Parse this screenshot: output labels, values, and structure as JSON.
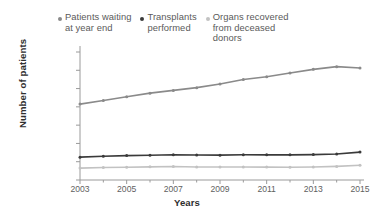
{
  "chart_data": {
    "type": "line",
    "title": "",
    "xlabel": "Years",
    "ylabel": "Number of patients",
    "x": [
      2003,
      2004,
      2005,
      2006,
      2007,
      2008,
      2009,
      2010,
      2011,
      2012,
      2013,
      2014,
      2015
    ],
    "xtick_labels": [
      "2003",
      "2005",
      "2007",
      "2009",
      "2011",
      "2013",
      "2015"
    ],
    "xtick_values": [
      2003,
      2005,
      2007,
      2009,
      2011,
      2013,
      2015
    ],
    "xlim": [
      2003,
      2015
    ],
    "ylim": [
      0,
      140000
    ],
    "ytick_labels": [
      "0",
      "20,000",
      "40,000",
      "60,000",
      "80,000",
      "100,000",
      "120,000",
      "140,000"
    ],
    "ytick_values": [
      0,
      20000,
      40000,
      60000,
      80000,
      100000,
      120000,
      140000
    ],
    "grid": false,
    "legend_position": "top",
    "series": [
      {
        "name": "Patients waiting at year end",
        "color": "#8a8a8a",
        "values": [
          83000,
          87000,
          91000,
          95000,
          98000,
          101000,
          105000,
          110000,
          113000,
          117000,
          121000,
          124000,
          122500
        ]
      },
      {
        "name": "Transplants performed",
        "color": "#3a3a3a",
        "values": [
          25000,
          26000,
          26700,
          27100,
          27600,
          27300,
          27200,
          27600,
          27500,
          27500,
          27800,
          28500,
          30500
        ]
      },
      {
        "name": "Organs recovered from deceased donors",
        "color": "#c2c2c2",
        "values": [
          13000,
          13700,
          14000,
          14400,
          14700,
          14300,
          14200,
          14300,
          14100,
          14000,
          14200,
          14900,
          16100
        ]
      }
    ]
  },
  "legend": {
    "items": [
      {
        "label": "Patients waiting\nat year end",
        "color": "#8a8a8a"
      },
      {
        "label": "Transplants\nperformed",
        "color": "#3a3a3a"
      },
      {
        "label": "Organs recovered\nfrom deceased\ndonors",
        "color": "#c2c2c2"
      }
    ]
  },
  "axes": {
    "y_title": "Number of patients",
    "x_title": "Years",
    "axis_color": "#9a9a9a"
  }
}
